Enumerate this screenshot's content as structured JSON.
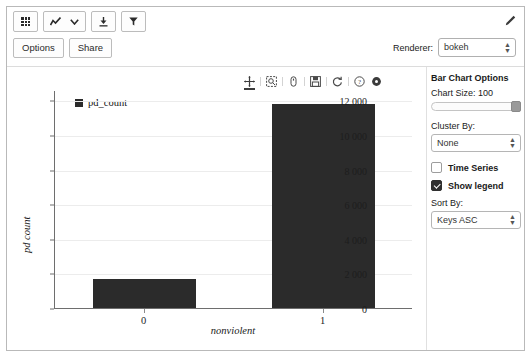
{
  "toolbar": {
    "table_icon": "table-icon",
    "chart_icon": "line-chart-icon",
    "chevron_icon": "chevron-down-icon",
    "download_icon": "download-icon",
    "filter_icon": "funnel-icon",
    "pencil_icon": "pencil-icon",
    "options_label": "Options",
    "share_label": "Share",
    "renderer_label": "Renderer:",
    "renderer_value": "bokeh",
    "renderer_options": [
      "bokeh"
    ]
  },
  "bokeh_toolbar": {
    "tools": [
      {
        "name": "pan-tool-icon",
        "active": true
      },
      {
        "name": "box-zoom-tool-icon",
        "active": false
      },
      {
        "name": "wheel-zoom-tool-icon",
        "active": false
      },
      {
        "name": "save-tool-icon",
        "active": false
      },
      {
        "name": "reset-tool-icon",
        "active": false
      },
      {
        "name": "help-tool-icon",
        "active": false
      },
      {
        "name": "bokeh-logo-icon",
        "active": false
      }
    ]
  },
  "options_panel": {
    "title": "Bar Chart Options",
    "chart_size_label": "Chart Size: 100",
    "chart_size_value": 100,
    "cluster_by_label": "Cluster By:",
    "cluster_by_value": "None",
    "cluster_by_options": [
      "None"
    ],
    "time_series_label": "Time Series",
    "time_series_checked": false,
    "show_legend_label": "Show legend",
    "show_legend_checked": true,
    "sort_by_label": "Sort By:",
    "sort_by_value": "Keys ASC",
    "sort_by_options": [
      "Keys ASC"
    ]
  },
  "chart_data": {
    "type": "bar",
    "title": "",
    "categories": [
      "0",
      "1"
    ],
    "series": [
      {
        "name": "pd_count",
        "values": [
          1700,
          11800
        ],
        "color": "#2b2b2b"
      }
    ],
    "xlabel": "nonviolent",
    "ylabel": "pd count",
    "ylim": [
      0,
      12600
    ],
    "yticks": [
      0,
      2000,
      4000,
      6000,
      8000,
      10000,
      12000
    ],
    "ytick_labels": [
      "0",
      "2 000",
      "4 000",
      "6 000",
      "8 000",
      "10 000",
      "12 000"
    ],
    "grid": true,
    "legend": {
      "visible": true,
      "position": "top-left",
      "entries": [
        "pd_count"
      ]
    }
  }
}
